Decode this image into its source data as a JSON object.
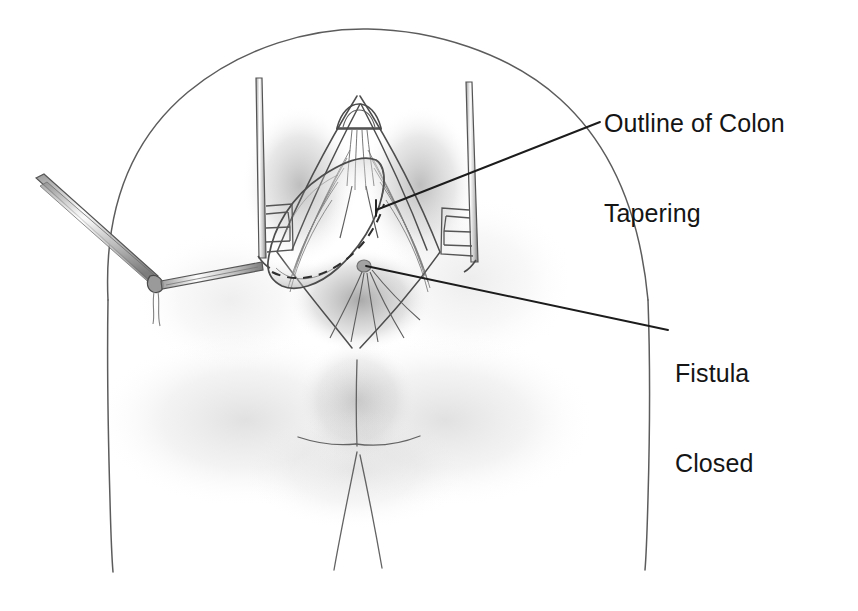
{
  "figure": {
    "kind": "medical-surgical-illustration",
    "medium": "pencil-drawing",
    "title_visible": false,
    "background_color": "#ffffff",
    "ink_color": "#3a3a3a",
    "text_color": "#151515",
    "canvas": {
      "width": 858,
      "height": 611
    }
  },
  "labels": [
    {
      "id": "colon-tapering",
      "line1": "Outline of Colon",
      "line2": "Tapering",
      "x": 604,
      "y": 48,
      "font_size_px": 25,
      "leader_from": {
        "x": 600,
        "y": 122
      },
      "leader_to": {
        "x": 376,
        "y": 210
      }
    },
    {
      "id": "fistula-closed",
      "line1": "Fistula",
      "line2": "Closed",
      "x": 675,
      "y": 298,
      "font_size_px": 25,
      "leader_from": {
        "x": 668,
        "y": 330
      },
      "leader_to": {
        "x": 366,
        "y": 266
      }
    }
  ],
  "annotations": {
    "dashed_line_name": "colon-tapering-resection-line",
    "dashed_line_style": "dashed",
    "instruments": [
      {
        "name": "left-retractor",
        "type": "toothed-retractor-blade"
      },
      {
        "name": "right-retractor",
        "type": "toothed-retractor-blade"
      },
      {
        "name": "forceps",
        "type": "hemostat-forceps"
      }
    ],
    "suture": {
      "name": "suture-tail",
      "visible": true
    }
  }
}
